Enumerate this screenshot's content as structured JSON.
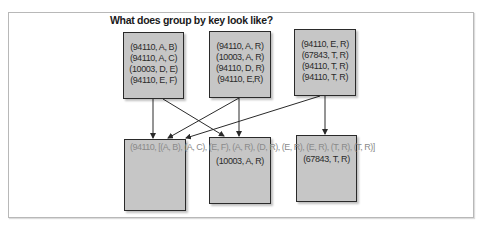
{
  "title": "What does group by key look like?",
  "input_partitions": [
    {
      "records": [
        "(94110, A, B)",
        "(94110, A, C)",
        "(10003, D, E)",
        "(94110, E, F)"
      ]
    },
    {
      "records": [
        "(94110, A, R)",
        "(10003, A, R)",
        "(94110, D, R)",
        "(94110, E,R)"
      ]
    },
    {
      "records": [
        "(94110, E, R)",
        "(67843, T, R)",
        "(94110, T, R)",
        "(94110, T, R)"
      ]
    }
  ],
  "output_partitions": [
    {
      "records": []
    },
    {
      "records": [
        "(10003, A, R)"
      ]
    },
    {
      "records": [
        "(67843, T, R)"
      ]
    }
  ],
  "grouped_overlay_text": "(94110, [(A, B), (A, C), (E, F), (A, R), (D, R), (E, R), (E, R), (T, R), (T, R)]",
  "colors": {
    "box_fill": "#c6c6c6",
    "box_border": "#2a2a2a",
    "arrow": "#2a2a2a",
    "overlay_text": "#8a8a8a"
  }
}
